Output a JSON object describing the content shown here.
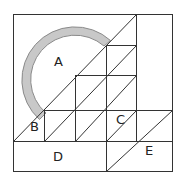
{
  "diagram": {
    "labels": {
      "a": "A",
      "b": "B",
      "c": "C",
      "d": "D",
      "e": "E"
    },
    "colors": {
      "stroke": "#333333",
      "arc_fill": "#c8c8c8",
      "arc_stroke": "#8a8a8a",
      "background": "#ffffff"
    }
  }
}
